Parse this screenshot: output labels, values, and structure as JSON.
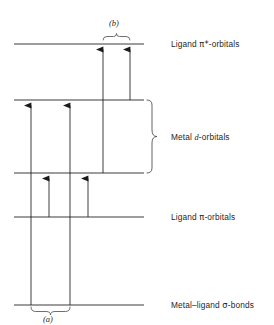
{
  "figure": {
    "kind": "energy-level-diagram",
    "background_color": "#ffffff",
    "line_color": "#3c3c3c",
    "arrow_color": "#2a2a2a",
    "text_color": "#1f1f1f"
  },
  "levels": [
    {
      "id": "ligand-pi-star",
      "label": "Ligand π*-orbitals",
      "label_prefix": "Ligand ",
      "label_symbol": "π*",
      "label_suffix": "-orbitals",
      "y": 44,
      "x_start": 14,
      "x_end": 144,
      "label_x": 171,
      "label_y": 40
    },
    {
      "id": "metal-d-upper",
      "label": "",
      "y": 100,
      "x_start": 14,
      "x_end": 144
    },
    {
      "id": "metal-d-lower",
      "label": "",
      "y": 173,
      "x_start": 14,
      "x_end": 144
    },
    {
      "id": "ligand-pi",
      "label": "Ligand π-orbitals",
      "label_prefix": "Ligand ",
      "label_symbol": "π",
      "label_suffix": "-orbitals",
      "y": 217,
      "x_start": 14,
      "x_end": 144,
      "label_x": 171,
      "label_y": 213
    },
    {
      "id": "metal-ligand-sigma",
      "label": "Metal–ligand σ-bonds",
      "label_prefix": "Metal–ligand ",
      "label_symbol": "σ",
      "label_suffix": "-bonds",
      "y": 305,
      "x_start": 14,
      "x_end": 144,
      "label_x": 171,
      "label_y": 301
    }
  ],
  "brace_label": {
    "id": "metal-d-brace",
    "label": "Metal d-orbitals",
    "label_prefix": "Metal ",
    "label_italic": "d",
    "label_suffix": "-orbitals",
    "y_top": 100,
    "y_bottom": 173,
    "x": 149,
    "label_x": 171,
    "label_y": 133
  },
  "transitions": [
    {
      "id": "t1",
      "x": 31,
      "from_y": 305,
      "to_y": 100,
      "group": "a",
      "direction": "up"
    },
    {
      "id": "t2",
      "x": 49,
      "from_y": 217,
      "to_y": 173,
      "group": "a",
      "direction": "up"
    },
    {
      "id": "t3",
      "x": 70,
      "from_y": 305,
      "to_y": 100,
      "group": "a",
      "direction": "up"
    },
    {
      "id": "t4",
      "x": 88,
      "from_y": 217,
      "to_y": 173,
      "group": "a",
      "direction": "up"
    },
    {
      "id": "t5",
      "x": 103,
      "from_y": 173,
      "to_y": 44,
      "group": "b",
      "direction": "up"
    },
    {
      "id": "t6",
      "x": 130,
      "from_y": 100,
      "to_y": 44,
      "group": "b",
      "direction": "up"
    }
  ],
  "groups": [
    {
      "id": "group-b",
      "label": "(b)",
      "brace_x_start": 103,
      "brace_x_end": 130,
      "brace_y": 37,
      "orientation": "above",
      "label_x": 109,
      "label_y": 19
    },
    {
      "id": "group-a",
      "label": "(a)",
      "brace_x_start": 31,
      "brace_x_end": 70,
      "brace_y": 310,
      "orientation": "below",
      "label_x": 43,
      "label_y": 315
    }
  ]
}
